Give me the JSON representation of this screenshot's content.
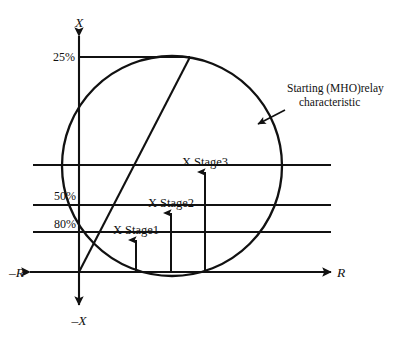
{
  "figure": {
    "type": "impedance-rx-diagram",
    "background": "#ffffff",
    "ink_color": "#111111",
    "axes": {
      "x_positive_label": "X",
      "x_negative_label": "–X",
      "r_positive_label": "R",
      "r_negative_label": "–R",
      "origin": {
        "x": 79,
        "y": 272
      }
    },
    "reach_lines": [
      {
        "id": "reach-25",
        "label": "25%",
        "y": 57,
        "x_start": 79,
        "x_end": 190,
        "label_x": 54,
        "label_y": 61
      },
      {
        "id": "reach-stage3",
        "label": "",
        "y": 165,
        "x_start": 33,
        "x_end": 331
      },
      {
        "id": "reach-50",
        "label": "50%",
        "y": 205,
        "x_start": 33,
        "x_end": 331,
        "label_x": 60,
        "label_y": 200
      },
      {
        "id": "reach-80",
        "label": "80%",
        "y": 232,
        "x_start": 33,
        "x_end": 331,
        "label_x": 60,
        "label_y": 228
      }
    ],
    "mho_circle": {
      "center_x": 172,
      "center_y": 166,
      "radius": 110,
      "description": "Starting (MHO) relay characteristic circle through origin"
    },
    "fault_line": {
      "from_x": 79,
      "from_y": 272,
      "to_x": 190,
      "to_y": 57,
      "description": "system impedance / line characteristic"
    },
    "stage_arrows": [
      {
        "id": "stage1",
        "label": "X Stage1",
        "x": 136,
        "y_base": 272,
        "y_tip": 240,
        "label_x": 136,
        "label_y": 234
      },
      {
        "id": "stage2",
        "label": "X Stage2",
        "x": 171,
        "y_base": 272,
        "y_tip": 213,
        "label_x": 171,
        "label_y": 207
      },
      {
        "id": "stage3",
        "label": "X Stage3",
        "x": 205,
        "y_base": 272,
        "y_tip": 172,
        "label_x": 205,
        "label_y": 166
      }
    ],
    "callout": {
      "line1": "Starting (MHO)relay",
      "line2": "characteristic",
      "text_x": 287,
      "line1_y": 92,
      "line2_y": 106,
      "arrow_from_x": 285,
      "arrow_from_y": 110,
      "arrow_to_x": 258,
      "arrow_to_y": 124
    }
  }
}
